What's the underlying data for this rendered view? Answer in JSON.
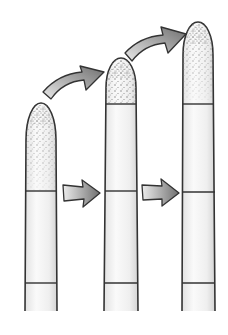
{
  "diagram": {
    "title": "",
    "colors": {
      "background": "#ffffff",
      "outline": "#333333",
      "cell_fill_light": "#f4f4f4",
      "cell_fill_shade": "#d6d6d6",
      "stipple": "#8a8a8a",
      "arrow_light": "#e6e6e6",
      "arrow_dark": "#777777"
    },
    "cells": [
      {
        "id": "cell-1",
        "x_left": 25,
        "x_right": 57,
        "tip_y": 103,
        "dividers_y": [
          191,
          283
        ],
        "bottom_y": 311
      },
      {
        "id": "cell-2",
        "x_left": 105,
        "x_right": 137,
        "tip_y": 58,
        "dividers_y": [
          104,
          191,
          283
        ],
        "bottom_y": 311
      },
      {
        "id": "cell-3",
        "x_left": 182,
        "x_right": 215,
        "tip_y": 22,
        "dividers_y": [
          104,
          192,
          283
        ],
        "bottom_y": 311
      }
    ],
    "arrows": [
      {
        "type": "curved",
        "from": "cell-1 tip",
        "to": "cell-2 tip"
      },
      {
        "type": "curved",
        "from": "cell-2 tip",
        "to": "cell-3 tip"
      },
      {
        "type": "straight",
        "from": "cell-1 middle",
        "to": "cell-2 middle"
      },
      {
        "type": "straight",
        "from": "cell-2 middle",
        "to": "cell-3 middle"
      }
    ]
  }
}
